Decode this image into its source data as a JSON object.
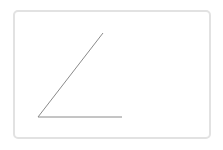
{
  "diagram": {
    "type": "angle",
    "frame": {
      "border_color": "#e2e2e2",
      "background": "#ffffff"
    },
    "line_color": "#8a8a8a",
    "vertex": [
      38,
      117
    ],
    "ray_1_end": [
      103,
      33
    ],
    "ray_2_end": [
      122,
      117
    ]
  }
}
